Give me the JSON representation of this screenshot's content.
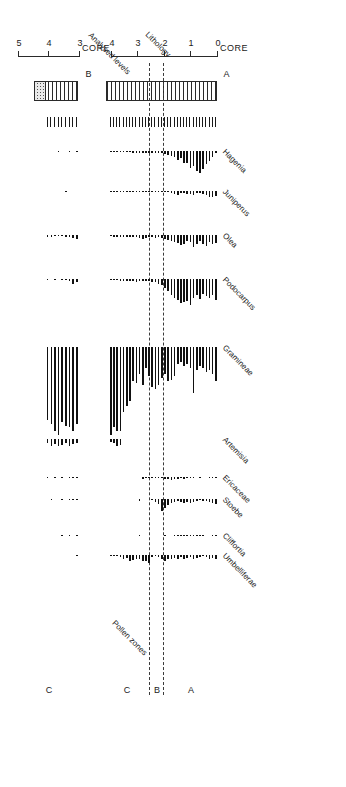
{
  "figure": {
    "rotation_deg": 180,
    "headers": {
      "pollen_zones": "Pollen zones",
      "depth_axis": "Depth below sediment surface (m)",
      "lithology": "Lithology",
      "analysed_levels": "Analysed levels"
    },
    "cores": [
      {
        "id": "core-a",
        "label": "CORE",
        "letter": "A",
        "tick_labels": [
          "0",
          "1",
          "2",
          "3",
          "4"
        ],
        "zones": [
          "A",
          "B",
          "C"
        ]
      },
      {
        "id": "core-b",
        "label": "CORE",
        "letter": "B",
        "tick_labels": [
          "3",
          "4",
          "5"
        ],
        "zones": [
          "C"
        ]
      }
    ],
    "taxa": [
      "Hagenia",
      "Juniperus",
      "Olea",
      "Podocarpus",
      "Gramineae",
      "Artemisia",
      "Ericaceae",
      "Stoebe",
      "Cliffortia",
      "Umbelliferae"
    ]
  },
  "chart_data": {
    "type": "bar",
    "title": "Pollen zones",
    "xlabel": "Depth below sediment surface (m)",
    "ylabel": "Pollen percentage",
    "grid": false,
    "legend": "none",
    "axis_ranges": {
      "core_a_depth_m": [
        0,
        4.3
      ],
      "core_b_depth_m": [
        2.9,
        5.1
      ]
    },
    "zone_boundaries_m": {
      "core_a": [
        2.05,
        2.55
      ]
    },
    "panels": [
      {
        "core": "CORE A",
        "depth_ticks_m": [
          0,
          1,
          2,
          3,
          4
        ],
        "zones": [
          {
            "name": "A",
            "from_m": 0.0,
            "to_m": 2.05
          },
          {
            "name": "B",
            "from_m": 2.05,
            "to_m": 2.55
          },
          {
            "name": "C",
            "from_m": 2.55,
            "to_m": 4.3
          }
        ],
        "lithology": {
          "from_m": 0.05,
          "to_m": 4.15,
          "pattern": "vertical-hatch"
        },
        "analysed_levels_m": [
          0.08,
          0.2,
          0.32,
          0.44,
          0.56,
          0.68,
          0.8,
          0.92,
          1.04,
          1.16,
          1.28,
          1.4,
          1.52,
          1.64,
          1.76,
          1.88,
          2.0,
          2.12,
          2.24,
          2.36,
          2.48,
          2.6,
          2.72,
          2.84,
          2.96,
          3.08,
          3.2,
          3.32,
          3.44,
          3.56,
          3.68,
          3.8,
          3.92,
          4.04
        ],
        "series": [
          {
            "name": "Hagenia",
            "values": [
              3,
              7,
              12,
              16,
              22,
              26,
              24,
              18,
              20,
              15,
              14,
              9,
              11,
              7,
              6,
              5,
              4,
              3,
              3,
              2,
              2,
              2,
              2,
              2,
              2,
              2,
              2,
              1,
              1,
              1,
              1,
              1,
              1,
              1
            ]
          },
          {
            "name": "Juniperus",
            "values": [
              7,
              9,
              8,
              6,
              4,
              3,
              3,
              5,
              4,
              4,
              3,
              3,
              5,
              4,
              3,
              2,
              2,
              1,
              1,
              1,
              2,
              1,
              1,
              1,
              1,
              1,
              1,
              1,
              1,
              1,
              1,
              1,
              1,
              1
            ]
          },
          {
            "name": "Olea",
            "values": [
              10,
              12,
              9,
              14,
              11,
              8,
              12,
              15,
              9,
              7,
              11,
              13,
              10,
              9,
              8,
              6,
              5,
              4,
              3,
              4,
              3,
              2,
              4,
              5,
              4,
              3,
              3,
              2,
              2,
              3,
              2,
              2,
              2,
              1
            ]
          },
          {
            "name": "Podocarpus",
            "values": [
              18,
              14,
              16,
              15,
              13,
              17,
              14,
              16,
              22,
              19,
              20,
              21,
              18,
              16,
              14,
              10,
              8,
              5,
              4,
              3,
              3,
              2,
              2,
              2,
              2,
              3,
              2,
              2,
              2,
              2,
              2,
              1,
              1,
              1
            ]
          },
          {
            "name": "Gramineae",
            "values": [
              18,
              14,
              12,
              13,
              11,
              10,
              12,
              24,
              11,
              9,
              10,
              8,
              9,
              15,
              17,
              18,
              14,
              16,
              20,
              22,
              21,
              15,
              11,
              20,
              14,
              19,
              18,
              28,
              31,
              34,
              44,
              44,
              42,
              46
            ]
          },
          {
            "name": "Artemisia",
            "values": [
              0,
              0,
              0,
              0,
              0,
              0,
              0,
              0,
              0,
              0,
              0,
              0,
              0,
              0,
              0,
              0,
              0,
              0,
              0,
              0,
              0,
              0,
              0,
              0,
              0,
              0,
              0,
              0,
              0,
              0,
              8,
              10,
              6,
              4
            ]
          },
          {
            "name": "Ericaceae",
            "values": [
              1,
              2,
              1,
              0,
              0,
              1,
              0,
              1,
              2,
              3,
              4,
              3,
              5,
              4,
              6,
              5,
              4,
              3,
              2,
              2,
              1,
              2,
              3,
              5,
              0,
              0,
              0,
              0,
              0,
              0,
              0,
              0,
              0,
              0
            ]
          },
          {
            "name": "Stoebe",
            "values": [
              7,
              5,
              4,
              3,
              3,
              2,
              3,
              4,
              5,
              4,
              5,
              4,
              3,
              4,
              6,
              8,
              12,
              16,
              7,
              4,
              2,
              0,
              0,
              0,
              3,
              0,
              0,
              0,
              0,
              0,
              0,
              0,
              0,
              0
            ]
          },
          {
            "name": "Cliffortia",
            "values": [
              2,
              2,
              0,
              0,
              1,
              2,
              2,
              1,
              2,
              1,
              2,
              1,
              3,
              1,
              0,
              0,
              2,
              0,
              0,
              0,
              0,
              0,
              0,
              0,
              2,
              0,
              0,
              0,
              0,
              0,
              0,
              0,
              0,
              0
            ]
          },
          {
            "name": "Umbelliferae",
            "values": [
              6,
              4,
              5,
              3,
              2,
              3,
              4,
              5,
              3,
              4,
              5,
              3,
              6,
              4,
              5,
              6,
              8,
              5,
              3,
              2,
              3,
              12,
              9,
              8,
              5,
              6,
              7,
              9,
              4,
              5,
              3,
              2,
              2,
              1
            ]
          }
        ]
      },
      {
        "core": "CORE B",
        "depth_ticks_m": [
          3,
          4,
          5
        ],
        "zones": [
          {
            "name": "C",
            "from_m": 2.9,
            "to_m": 5.1
          }
        ],
        "lithology": {
          "from_m": 3.05,
          "to_m": 4.45,
          "pattern": "vertical-hatch",
          "stipple_from_m": 4.12,
          "stipple_to_m": 4.45
        },
        "analysed_levels_m": [
          3.1,
          3.22,
          3.34,
          3.46,
          3.58,
          3.7,
          3.82,
          3.94,
          4.06
        ],
        "series": [
          {
            "name": "Hagenia",
            "values": [
              1,
              0,
              1,
              0,
              0,
              1,
              0,
              0,
              0
            ]
          },
          {
            "name": "Juniperus",
            "values": [
              0,
              0,
              0,
              1,
              0,
              0,
              0,
              0,
              0
            ]
          },
          {
            "name": "Olea",
            "values": [
              5,
              4,
              3,
              2,
              1,
              1,
              1,
              2,
              3
            ]
          },
          {
            "name": "Podocarpus",
            "values": [
              3,
              4,
              2,
              1,
              1,
              0,
              1,
              0,
              1
            ]
          },
          {
            "name": "Gramineae",
            "values": [
              40,
              44,
              42,
              41,
              39,
              46,
              44,
              40,
              38
            ]
          },
          {
            "name": "Artemisia",
            "values": [
              5,
              7,
              9,
              6,
              8,
              10,
              7,
              9,
              6
            ]
          },
          {
            "name": "Ericaceae",
            "values": [
              2,
              2,
              1,
              0,
              1,
              0,
              1,
              0,
              3
            ]
          },
          {
            "name": "Stoebe",
            "values": [
              2,
              2,
              1,
              0,
              1,
              0,
              0,
              2,
              0
            ]
          },
          {
            "name": "Cliffortia",
            "values": [
              1,
              0,
              1,
              0,
              1,
              0,
              0,
              0,
              0
            ]
          },
          {
            "name": "Umbelliferae",
            "values": [
              2,
              0,
              0,
              0,
              0,
              0,
              0,
              0,
              0
            ]
          }
        ]
      }
    ]
  }
}
